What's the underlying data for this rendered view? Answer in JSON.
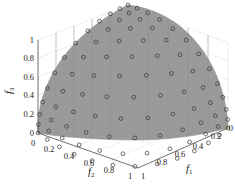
{
  "chart_data": {
    "type": "scatter3d",
    "title": "",
    "xlabel": "f1",
    "ylabel": "f2",
    "zlabel": "f3",
    "xlim": [
      0,
      1
    ],
    "ylim": [
      0,
      1
    ],
    "zlim": [
      0,
      1
    ],
    "x_ticks": [
      "0",
      "0.2",
      "0.4",
      "0.6",
      "0.8",
      "1"
    ],
    "y_ticks": [
      "0",
      "0.2",
      "0.4",
      "0.6",
      "0.8",
      "1"
    ],
    "z_ticks": [
      "0",
      "0.2",
      "0.4",
      "0.6",
      "0.8",
      "1"
    ],
    "grid": true,
    "surface_color": "#9a9a9a",
    "marker": "open circle",
    "marker_color": "#333333",
    "approx_point_count": 105
  },
  "axes": {
    "f1": {
      "label": "f",
      "sub": "1"
    },
    "f2": {
      "label": "f",
      "sub": "2"
    },
    "f3": {
      "label": "f",
      "sub": "3"
    }
  },
  "ticks": {
    "z": [
      "0",
      "0.2",
      "0.4",
      "0.6",
      "0.8",
      "1"
    ],
    "f2": [
      "0",
      "0.2",
      "0.4",
      "0.6",
      "0.8",
      "1"
    ],
    "f1": [
      "0",
      "0.2",
      "0.4",
      "0.6",
      "0.8",
      "1"
    ]
  }
}
